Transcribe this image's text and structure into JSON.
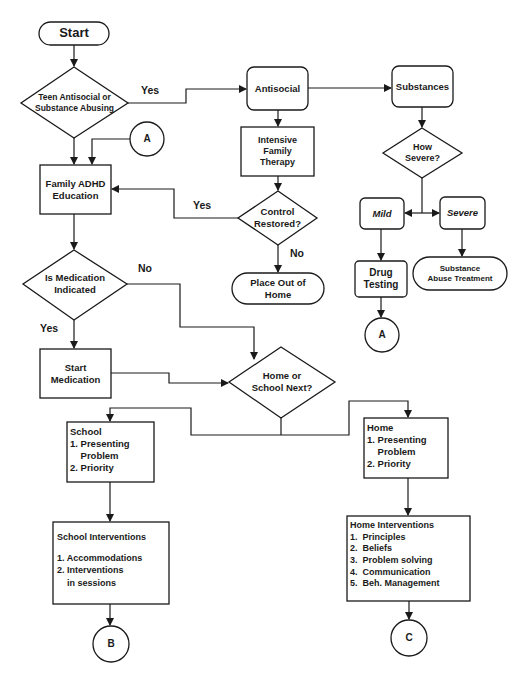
{
  "diagram": {
    "type": "flowchart",
    "nodes": {
      "start": {
        "label": "Start",
        "shape": "terminator"
      },
      "teen": {
        "lines": [
          "Teen Antisocial or",
          "Substance Abusing"
        ],
        "shape": "decision"
      },
      "antisocial": {
        "label": "Antisocial",
        "shape": "rounded-rect"
      },
      "substances": {
        "label": "Substances",
        "shape": "rounded-rect"
      },
      "connector_a_top": {
        "label": "A",
        "shape": "connector"
      },
      "family_adhd": {
        "lines": [
          "Family ADHD",
          "Education"
        ],
        "shape": "rect"
      },
      "intensive": {
        "lines": [
          "Intensive",
          "Family",
          "Therapy"
        ],
        "shape": "rect"
      },
      "how_severe": {
        "lines": [
          "How",
          "Severe?"
        ],
        "shape": "decision"
      },
      "control": {
        "lines": [
          "Control",
          "Restored?"
        ],
        "shape": "decision"
      },
      "mild": {
        "label": "Mild",
        "shape": "rounded-rect"
      },
      "severe": {
        "label": "Severe",
        "shape": "rounded-rect"
      },
      "place_out": {
        "lines": [
          "Place Out of",
          "Home"
        ],
        "shape": "terminator"
      },
      "drug_testing": {
        "lines": [
          "Drug",
          "Testing"
        ],
        "shape": "rounded-rect"
      },
      "sub_treatment": {
        "lines": [
          "Substance",
          "Abuse Treatment"
        ],
        "shape": "terminator"
      },
      "connector_a_bottom": {
        "label": "A",
        "shape": "connector"
      },
      "medication": {
        "lines": [
          "Is Medication",
          "Indicated"
        ],
        "shape": "decision"
      },
      "start_med": {
        "lines": [
          "Start",
          "Medication"
        ],
        "shape": "rect"
      },
      "home_school": {
        "lines": [
          "Home or",
          "School Next?"
        ],
        "shape": "decision"
      },
      "school": {
        "lines": [
          "School",
          "1. Presenting",
          "    Problem",
          "2. Priority"
        ],
        "shape": "rect"
      },
      "home": {
        "lines": [
          "Home",
          "1. Presenting",
          "    Problem",
          "2. Priority"
        ],
        "shape": "rect"
      },
      "school_int": {
        "title": "School Interventions",
        "items": [
          "1. Accommodations",
          "2. Interventions",
          "    in sessions"
        ],
        "shape": "rect"
      },
      "home_int": {
        "title": "Home Interventions",
        "items": [
          "1.  Principles",
          "2.  Beliefs",
          "3.  Problem solving",
          "4.  Communication",
          "5.  Beh. Management"
        ],
        "shape": "rect"
      },
      "connector_b": {
        "label": "B",
        "shape": "connector"
      },
      "connector_c": {
        "label": "C",
        "shape": "connector"
      }
    },
    "edge_labels": {
      "teen_yes": "Yes",
      "control_yes": "Yes",
      "control_no": "No",
      "med_no": "No",
      "med_yes": "Yes"
    }
  }
}
